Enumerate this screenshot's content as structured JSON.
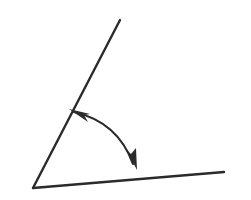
{
  "canvas": {
    "width": 251,
    "height": 200,
    "background_color": "#ffffff"
  },
  "diagram": {
    "name": "angle-with-rotation-arrow",
    "stroke_color": "#2b2b2b",
    "ray_stroke_width": 2.4,
    "arc_stroke_width": 2.2,
    "vertex": {
      "x": 33,
      "y": 188
    },
    "rays": [
      {
        "id": "upper-ray",
        "label": "",
        "from": {
          "x": 33,
          "y": 188
        },
        "to": {
          "x": 120,
          "y": 20
        }
      },
      {
        "id": "lower-ray",
        "label": "",
        "from": {
          "x": 33,
          "y": 188
        },
        "to": {
          "x": 224,
          "y": 172
        }
      }
    ],
    "arc": {
      "id": "angle-arc",
      "path": "M 74 112 Q 118 122 133 164",
      "start": {
        "x": 74,
        "y": 112
      },
      "control": {
        "x": 118,
        "y": 122
      },
      "end": {
        "x": 133,
        "y": 164
      },
      "double_headed": true
    },
    "arrow_heads": [
      {
        "id": "arrow-head-upper",
        "tip": {
          "x": 69,
          "y": 109
        },
        "direction_deg": 200,
        "points": "69,109 90,114 84,115 88,122"
      },
      {
        "id": "arrow-head-lower",
        "tip": {
          "x": 137,
          "y": 170
        },
        "direction_deg": 72,
        "points": "137,170 126,149 131,154 136,148"
      }
    ]
  }
}
